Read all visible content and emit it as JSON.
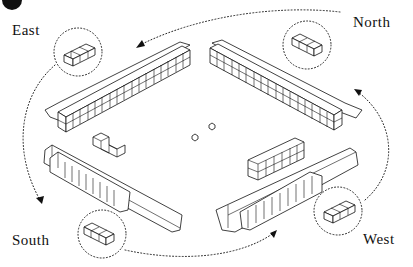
{
  "diagram": {
    "type": "mahjong-table-isometric",
    "seat_labels": {
      "east": "East",
      "north": "North",
      "south": "South",
      "west": "West"
    },
    "walls": [
      {
        "seat": "East",
        "position": "top-left",
        "rows": 2,
        "columns": 17
      },
      {
        "seat": "North",
        "position": "top-right",
        "rows": 2,
        "columns": 17
      },
      {
        "seat": "South",
        "position": "bottom-left",
        "tiles_standing": 10
      },
      {
        "seat": "West",
        "position": "bottom-right",
        "tiles_standing": 10
      }
    ],
    "center": {
      "dice_count": 2,
      "left_stack": "stepped tile stack",
      "right_stack": "2x6 tile block"
    },
    "flow": "dotted arrows circulating counter-clockwise between seats",
    "colors": {
      "line": "#111111",
      "background": "#ffffff"
    }
  }
}
